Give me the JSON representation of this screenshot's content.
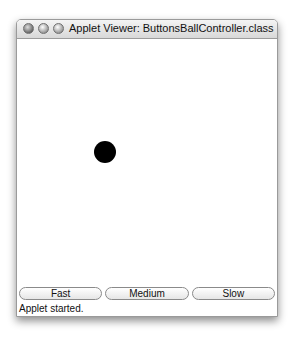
{
  "window": {
    "title": "Applet Viewer: ButtonsBallController.class",
    "controls": [
      "close",
      "minimize",
      "zoom"
    ]
  },
  "canvas": {
    "ball": {
      "color": "#000000",
      "diameter": 22
    }
  },
  "buttons": [
    {
      "label": "Fast"
    },
    {
      "label": "Medium"
    },
    {
      "label": "Slow"
    }
  ],
  "status": "Applet started."
}
